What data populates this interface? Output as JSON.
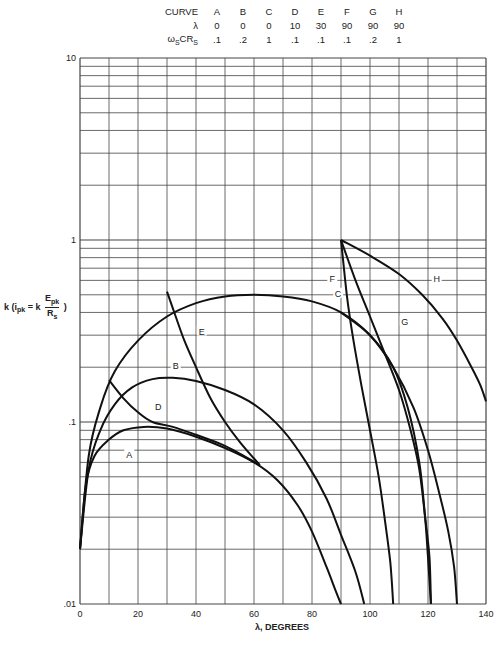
{
  "legend": {
    "row_labels": [
      "CURVE",
      "λ",
      "ω",
      "S",
      "CR",
      "S"
    ],
    "header": "CURVE",
    "lambda_label": "λ",
    "omega_label_main": "ω",
    "omega_label_sub": "S",
    "omega_label_cr": "CR",
    "omega_label_cr_sub": "S",
    "curves": [
      "A",
      "B",
      "C",
      "D",
      "E",
      "F",
      "G",
      "H"
    ],
    "lambda": [
      "0",
      "0",
      "0",
      "10",
      "30",
      "90",
      "90",
      "90"
    ],
    "omega_cr": [
      ".1",
      ".2",
      "1",
      ".1",
      ".1",
      ".1",
      ".2",
      "1"
    ]
  },
  "axes": {
    "ylabel_k": "k",
    "ylabel_i": "(i",
    "ylabel_i_sub": "pk",
    "ylabel_eq": "= k",
    "ylabel_num": "E",
    "ylabel_num_sub": "pk",
    "ylabel_den": "R",
    "ylabel_den_sub": "s",
    "ylabel_close": ")",
    "xlabel": "λ, DEGREES"
  },
  "chart_data": {
    "type": "line",
    "title": "",
    "xlabel": "λ, DEGREES",
    "ylabel": "k (i_pk = k E_pk / R_s)",
    "xlim": [
      0,
      140
    ],
    "ylim": [
      0.01,
      10
    ],
    "yscale": "log",
    "grid": true,
    "x_ticks": [
      0,
      20,
      40,
      60,
      80,
      100,
      120,
      140
    ],
    "x_tick_labels": [
      "0",
      "20",
      "40",
      "60",
      "80",
      "100",
      "120",
      "140"
    ],
    "y_ticks": [
      0.01,
      0.1,
      1,
      10
    ],
    "y_tick_labels": [
      ".01",
      ".1",
      "1",
      "10"
    ],
    "legend_table": {
      "curve": [
        "A",
        "B",
        "C",
        "D",
        "E",
        "F",
        "G",
        "H"
      ],
      "lambda": [
        0,
        0,
        0,
        10,
        30,
        90,
        90,
        90
      ],
      "omega_s_C_R_s": [
        0.1,
        0.2,
        1,
        0.1,
        0.1,
        0.1,
        0.2,
        1
      ]
    },
    "series": [
      {
        "name": "A",
        "label_at": [
          17,
          0.065
        ],
        "points": [
          [
            0,
            0.02
          ],
          [
            2,
            0.045
          ],
          [
            5,
            0.065
          ],
          [
            10,
            0.08
          ],
          [
            15,
            0.09
          ],
          [
            22,
            0.094
          ],
          [
            30,
            0.092
          ],
          [
            40,
            0.083
          ],
          [
            50,
            0.072
          ],
          [
            60,
            0.06
          ],
          [
            68,
            0.048
          ],
          [
            75,
            0.035
          ],
          [
            80,
            0.025
          ],
          [
            85,
            0.016
          ],
          [
            88,
            0.012
          ],
          [
            90,
            0.01
          ]
        ]
      },
      {
        "name": "B",
        "label_at": [
          33,
          0.2
        ],
        "points": [
          [
            0,
            0.02
          ],
          [
            3,
            0.055
          ],
          [
            7,
            0.09
          ],
          [
            12,
            0.125
          ],
          [
            18,
            0.155
          ],
          [
            25,
            0.172
          ],
          [
            32,
            0.175
          ],
          [
            40,
            0.168
          ],
          [
            50,
            0.15
          ],
          [
            60,
            0.125
          ],
          [
            70,
            0.09
          ],
          [
            78,
            0.06
          ],
          [
            85,
            0.038
          ],
          [
            90,
            0.024
          ],
          [
            95,
            0.015
          ],
          [
            98,
            0.01
          ]
        ]
      },
      {
        "name": "C",
        "label_at": [
          89,
          0.5
        ],
        "points": [
          [
            0,
            0.02
          ],
          [
            3,
            0.065
          ],
          [
            7,
            0.12
          ],
          [
            12,
            0.19
          ],
          [
            20,
            0.28
          ],
          [
            30,
            0.38
          ],
          [
            40,
            0.45
          ],
          [
            50,
            0.49
          ],
          [
            60,
            0.5
          ],
          [
            70,
            0.49
          ],
          [
            80,
            0.46
          ],
          [
            90,
            0.4
          ],
          [
            100,
            0.3
          ],
          [
            108,
            0.2
          ],
          [
            113,
            0.12
          ],
          [
            117,
            0.06
          ],
          [
            119,
            0.03
          ],
          [
            120,
            0.018
          ],
          [
            121,
            0.01
          ]
        ]
      },
      {
        "name": "D",
        "label_at": [
          27,
          0.12
        ],
        "points": [
          [
            10,
            0.17
          ],
          [
            15,
            0.135
          ],
          [
            20,
            0.113
          ],
          [
            25,
            0.1
          ],
          [
            32,
            0.094
          ],
          [
            40,
            0.085
          ],
          [
            50,
            0.074
          ],
          [
            58,
            0.063
          ],
          [
            62,
            0.058
          ]
        ]
      },
      {
        "name": "E",
        "label_at": [
          42,
          0.31
        ],
        "points": [
          [
            30,
            0.52
          ],
          [
            33,
            0.38
          ],
          [
            36,
            0.28
          ],
          [
            40,
            0.2
          ],
          [
            45,
            0.135
          ],
          [
            50,
            0.1
          ],
          [
            55,
            0.078
          ],
          [
            60,
            0.063
          ],
          [
            62,
            0.058
          ]
        ]
      },
      {
        "name": "F",
        "label_at": [
          87,
          0.6
        ],
        "points": [
          [
            90,
            1.0
          ],
          [
            92,
            0.5
          ],
          [
            94,
            0.3
          ],
          [
            97,
            0.16
          ],
          [
            100,
            0.09
          ],
          [
            103,
            0.05
          ],
          [
            105,
            0.03
          ],
          [
            107,
            0.017
          ],
          [
            108,
            0.01
          ]
        ]
      },
      {
        "name": "G",
        "label_at": [
          112,
          0.35
        ],
        "points": [
          [
            90,
            1.0
          ],
          [
            95,
            0.6
          ],
          [
            100,
            0.38
          ],
          [
            105,
            0.24
          ],
          [
            110,
            0.15
          ],
          [
            114,
            0.09
          ],
          [
            117,
            0.055
          ],
          [
            119,
            0.03
          ],
          [
            120.5,
            0.018
          ],
          [
            121,
            0.01
          ]
        ]
      },
      {
        "name": "H",
        "label_at": [
          123,
          0.6
        ],
        "points": [
          [
            90,
            1.0
          ],
          [
            100,
            0.82
          ],
          [
            110,
            0.65
          ],
          [
            118,
            0.5
          ],
          [
            125,
            0.37
          ],
          [
            130,
            0.28
          ],
          [
            135,
            0.2
          ],
          [
            138,
            0.16
          ],
          [
            140,
            0.13
          ]
        ]
      },
      {
        "name": "G2",
        "label_at": null,
        "points": [
          [
            90,
            0.4
          ],
          [
            100,
            0.3
          ],
          [
            108,
            0.2
          ],
          [
            115,
            0.12
          ],
          [
            120,
            0.07
          ],
          [
            124,
            0.04
          ],
          [
            127,
            0.025
          ],
          [
            129,
            0.016
          ],
          [
            130,
            0.01
          ]
        ]
      }
    ]
  }
}
